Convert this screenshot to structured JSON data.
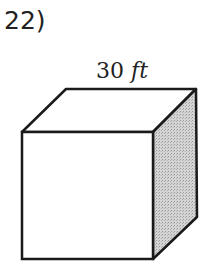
{
  "problem": {
    "number_label": "22)"
  },
  "figure": {
    "shape": "cube",
    "dimension_value": "30",
    "dimension_unit": "ft",
    "shaded_face": "right",
    "colors": {
      "stroke": "#1a1a1a",
      "shade": "#c8c8c8",
      "face": "#ffffff"
    }
  }
}
